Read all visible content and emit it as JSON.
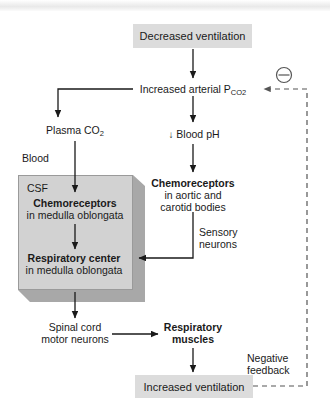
{
  "diagram": {
    "colors": {
      "node_fill": "#dcdcdc",
      "csf_fill": "#d2d2d2",
      "csf_shadow": "#a8a8a8",
      "line": "#1a1a1a",
      "dashed_line": "#555555",
      "text": "#1a1a1a"
    },
    "nodes": {
      "decreased_ventilation": "Decreased ventilation",
      "increased_arterial_pco2_main": "Increased arterial P",
      "increased_arterial_pco2_sub": "CO2",
      "plasma_co2_main": "Plasma CO",
      "plasma_co2_sub": "2",
      "blood_label": "Blood",
      "csf_label": "CSF",
      "blood_ph_arrow": "↓",
      "blood_ph_text": "Blood pH",
      "chemoreceptors_medulla_bold": "Chemoreceptors",
      "chemoreceptors_medulla_sub": "in medulla oblongata",
      "chemoreceptors_peripheral_bold": "Chemoreceptors",
      "chemoreceptors_peripheral_line1": "in aortic and",
      "chemoreceptors_peripheral_line2": "carotid bodies",
      "respiratory_center_bold": "Respiratory center",
      "respiratory_center_sub": "in medulla oblongata",
      "sensory_neurons_line1": "Sensory",
      "sensory_neurons_line2": "neurons",
      "spinal_cord_line1": "Spinal cord",
      "spinal_cord_line2": "motor neurons",
      "respiratory_muscles_line1": "Respiratory",
      "respiratory_muscles_line2": "muscles",
      "increased_ventilation": "Increased ventilation",
      "negative_feedback_line1": "Negative",
      "negative_feedback_line2": "feedback",
      "minus_symbol": "⊖"
    }
  }
}
